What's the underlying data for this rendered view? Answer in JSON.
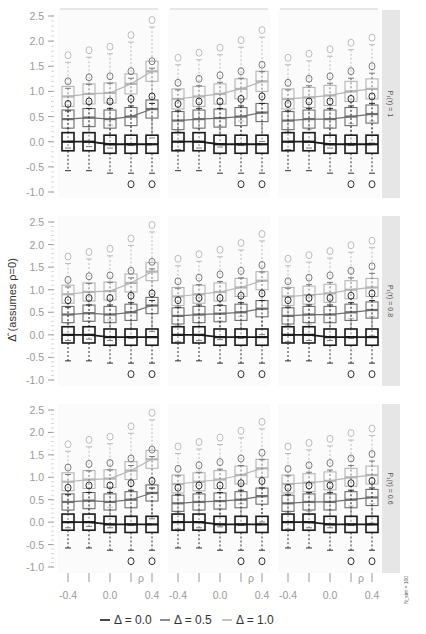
{
  "chart_data": {
    "type": "box",
    "title": "",
    "ylabel": "Δ̂  (assumes ρ=0)",
    "xlabel": "ρ",
    "x_ticks": [
      "-0.4",
      "0.0",
      "0.4"
    ],
    "x": [
      -0.4,
      -0.2,
      0.0,
      0.2,
      0.4
    ],
    "y_ticks": [
      "2.5",
      "2.0",
      "1.5",
      "1.0",
      "0.5",
      "0.0",
      "-0.5",
      "-1.0"
    ],
    "ylim": [
      -1.0,
      2.5
    ],
    "column_strips": [
      "β₁₂ = 0",
      "β₁₂ = 0.5",
      "β₁₂ = 1"
    ],
    "row_strips": [
      "P₁(τ) = 1",
      "P₁(τ) = 0.8",
      "P₁(τ) = 0.6"
    ],
    "note": "N_sim = 100",
    "legend": [
      {
        "label": "Δ = 0.0",
        "color": "#1a1a1a"
      },
      {
        "label": "Δ = 0.5",
        "color": "#6e6e6e"
      },
      {
        "label": "Δ = 1.0",
        "color": "#b5b5b5"
      }
    ],
    "series_medians": {
      "row1": {
        "col1": {
          "d0": [
            0.0,
            0.0,
            -0.05,
            -0.05,
            -0.05
          ],
          "d05": [
            0.45,
            0.48,
            0.45,
            0.5,
            0.65
          ],
          "d1": [
            0.9,
            0.95,
            0.97,
            1.15,
            1.4
          ]
        },
        "col2": {
          "d0": [
            0.0,
            0.0,
            -0.05,
            -0.05,
            -0.05
          ],
          "d05": [
            0.42,
            0.45,
            0.47,
            0.5,
            0.58
          ],
          "d1": [
            0.85,
            0.9,
            0.95,
            1.05,
            1.2
          ]
        },
        "col3": {
          "d0": [
            0.0,
            0.0,
            -0.05,
            -0.05,
            -0.05
          ],
          "d05": [
            0.42,
            0.45,
            0.45,
            0.5,
            0.55
          ],
          "d1": [
            0.85,
            0.88,
            0.92,
            1.0,
            1.05
          ]
        }
      },
      "row2": {
        "col1": {
          "d0": [
            0.0,
            0.0,
            -0.05,
            -0.05,
            -0.05
          ],
          "d05": [
            0.45,
            0.48,
            0.45,
            0.5,
            0.65
          ],
          "d1": [
            0.9,
            0.95,
            0.97,
            1.15,
            1.4
          ]
        },
        "col2": {
          "d0": [
            0.0,
            0.0,
            -0.05,
            -0.05,
            -0.05
          ],
          "d05": [
            0.42,
            0.45,
            0.47,
            0.5,
            0.58
          ],
          "d1": [
            0.85,
            0.9,
            0.95,
            1.05,
            1.2
          ]
        },
        "col3": {
          "d0": [
            0.0,
            0.0,
            -0.05,
            -0.05,
            -0.05
          ],
          "d05": [
            0.42,
            0.45,
            0.45,
            0.5,
            0.55
          ],
          "d1": [
            0.85,
            0.88,
            0.92,
            1.0,
            1.05
          ]
        }
      },
      "row3": {
        "col1": {
          "d0": [
            0.0,
            0.0,
            -0.05,
            -0.05,
            -0.05
          ],
          "d05": [
            0.45,
            0.48,
            0.45,
            0.5,
            0.65
          ],
          "d1": [
            0.9,
            0.95,
            0.97,
            1.15,
            1.4
          ]
        },
        "col2": {
          "d0": [
            0.0,
            0.0,
            -0.05,
            -0.05,
            -0.05
          ],
          "d05": [
            0.42,
            0.45,
            0.47,
            0.5,
            0.58
          ],
          "d1": [
            0.85,
            0.9,
            0.95,
            1.05,
            1.2
          ]
        },
        "col3": {
          "d0": [
            0.0,
            0.0,
            -0.05,
            -0.05,
            -0.05
          ],
          "d05": [
            0.42,
            0.45,
            0.45,
            0.5,
            0.55
          ],
          "d1": [
            0.85,
            0.88,
            0.92,
            1.0,
            1.05
          ]
        }
      }
    },
    "box_halfwidths": {
      "iqr_d0": 0.18,
      "iqr_d05": 0.18,
      "iqr_d1": 0.2
    },
    "grid": false,
    "legend_position": "bottom"
  }
}
